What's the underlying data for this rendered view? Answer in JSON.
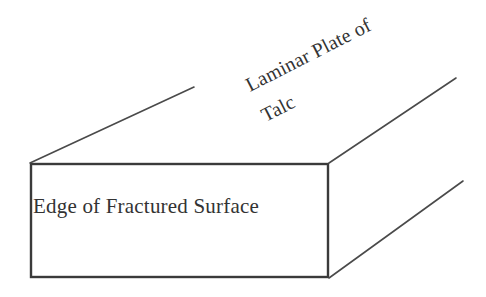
{
  "figure": {
    "background_color": "#ffffff",
    "line_color": "#3a3a3a",
    "text_color": "#333333",
    "width": 486,
    "height": 297
  },
  "labels": {
    "front_face": "Edge of Fractured Surface",
    "plate_line1": "Laminar Plate of",
    "plate_line2": "Talc"
  },
  "geometry": {
    "front_face_rect": {
      "x": 30,
      "y": 163,
      "width": 299,
      "height": 115
    },
    "depth_lines": [
      {
        "name": "top-left-depth-line",
        "x1": 30,
        "y1": 163,
        "x2": 194,
        "y2": 87
      },
      {
        "name": "top-right-depth-line",
        "x1": 329,
        "y1": 163,
        "x2": 456,
        "y2": 78
      },
      {
        "name": "bottom-right-depth-line",
        "x1": 329,
        "y1": 278,
        "x2": 463,
        "y2": 181
      }
    ],
    "plate_label_rotation_deg": -27
  }
}
